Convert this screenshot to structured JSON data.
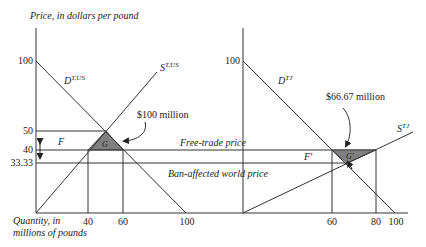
{
  "axes": {
    "y_label": "Price, in dollars per pound",
    "x_label_line1": "Quantity, in",
    "x_label_line2": "millions of pounds"
  },
  "left_panel": {
    "y_ticks": [
      "100",
      "50",
      "40",
      "33.33"
    ],
    "x_ticks": [
      "40",
      "60",
      "100"
    ],
    "demand_label": "D",
    "demand_sup": "T,US",
    "supply_label": "S",
    "supply_sup": "T,US",
    "area_F": "F",
    "area_G": "G",
    "annotation": "$100 million"
  },
  "right_panel": {
    "y_ticks": [
      "100"
    ],
    "x_ticks": [
      "60",
      "80",
      "100"
    ],
    "demand_label": "D",
    "demand_sup": "TJ",
    "supply_label": "S",
    "supply_sup": "TJ",
    "area_F": "F'",
    "area_G": "G'",
    "annotation": "$66.67 million"
  },
  "price_lines": {
    "free_trade": "Free-trade price",
    "ban_affected": "Ban-affected world price"
  },
  "colors": {
    "line": "#333333",
    "shaded_triangle": "#808080"
  }
}
